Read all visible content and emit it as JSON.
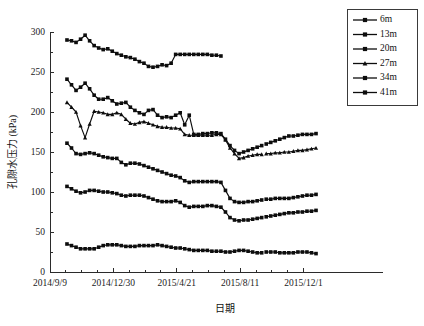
{
  "chart_data": {
    "type": "line",
    "title": "",
    "xlabel": "日期",
    "ylabel": "孔隙水压力 (kPa)",
    "ylim": [
      0,
      300
    ],
    "y_major_ticks": [
      0,
      50,
      100,
      150,
      200,
      250,
      300
    ],
    "y_tick_labels": [
      "0",
      "50",
      "100",
      "150",
      "200",
      "250",
      "300"
    ],
    "y_minor_interval": 25,
    "x_tick_labels": [
      "2014/9/9",
      "2014/12/30",
      "2015/4/21",
      "2015/8/11",
      "2015/12/1"
    ],
    "x_tick_days": [
      0,
      112,
      224,
      336,
      448
    ],
    "x_minor_interval_days": 28,
    "xlim_days": [
      0,
      500
    ],
    "grid": false,
    "legend_position": "top-right",
    "legend_entries": [
      "6m",
      "13m",
      "20m",
      "27m",
      "34m",
      "41m"
    ],
    "series": [
      {
        "name": "6m",
        "marker": "square",
        "x": [
          30,
          38,
          46,
          54,
          62,
          70,
          78,
          86,
          94,
          102,
          110,
          118,
          126,
          134,
          142,
          150,
          158,
          166,
          174,
          182,
          190,
          198,
          206,
          214,
          222,
          230,
          238,
          246,
          254,
          262,
          270,
          278,
          286,
          294,
          302,
          310,
          318,
          326,
          334,
          342,
          350,
          358,
          366,
          374,
          382,
          390,
          398,
          406,
          414,
          422,
          430,
          438,
          446,
          454,
          462,
          470
        ],
        "values": [
          35,
          33,
          31,
          29,
          29,
          29,
          29,
          31,
          33,
          34,
          34,
          34,
          33,
          32,
          32,
          32,
          33,
          33,
          33,
          33,
          34,
          33,
          32,
          31,
          30,
          30,
          29,
          28,
          27,
          27,
          27,
          27,
          26,
          26,
          26,
          25,
          25,
          26,
          27,
          27,
          26,
          25,
          24,
          24,
          25,
          25,
          25,
          24,
          24,
          24,
          24,
          25,
          25,
          25,
          24,
          23
        ]
      },
      {
        "name": "13m",
        "marker": "square",
        "x": [
          30,
          38,
          46,
          54,
          62,
          70,
          78,
          86,
          94,
          102,
          110,
          118,
          126,
          134,
          142,
          150,
          158,
          166,
          174,
          182,
          190,
          198,
          206,
          214,
          222,
          230,
          238,
          246,
          254,
          262,
          270,
          278,
          286,
          294,
          302,
          310,
          318,
          326,
          334,
          342,
          350,
          358,
          366,
          374,
          382,
          390,
          398,
          406,
          414,
          422,
          430,
          438,
          446,
          454,
          462,
          470
        ],
        "values": [
          107,
          104,
          101,
          99,
          100,
          102,
          102,
          101,
          100,
          100,
          99,
          98,
          96,
          95,
          96,
          96,
          96,
          95,
          93,
          91,
          89,
          88,
          88,
          88,
          89,
          87,
          83,
          81,
          82,
          82,
          82,
          83,
          83,
          82,
          81,
          75,
          68,
          65,
          64,
          65,
          65,
          66,
          67,
          68,
          69,
          70,
          71,
          72,
          73,
          74,
          74,
          75,
          75,
          76,
          76,
          77
        ]
      },
      {
        "name": "20m",
        "marker": "square",
        "x": [
          30,
          38,
          46,
          54,
          62,
          70,
          78,
          86,
          94,
          102,
          110,
          118,
          126,
          134,
          142,
          150,
          158,
          166,
          174,
          182,
          190,
          198,
          206,
          214,
          222,
          230,
          238,
          246,
          254,
          262,
          270,
          278,
          286,
          294,
          302,
          310,
          318,
          326,
          334,
          342,
          350,
          358,
          366,
          374,
          382,
          390,
          398,
          406,
          414,
          422,
          430,
          438,
          446,
          454,
          462,
          470
        ],
        "values": [
          161,
          155,
          148,
          147,
          148,
          149,
          148,
          146,
          144,
          143,
          142,
          142,
          137,
          134,
          136,
          136,
          135,
          133,
          131,
          129,
          127,
          125,
          123,
          121,
          120,
          118,
          114,
          112,
          113,
          113,
          113,
          113,
          113,
          113,
          112,
          102,
          92,
          88,
          87,
          87,
          88,
          88,
          89,
          90,
          91,
          91,
          92,
          92,
          92,
          92,
          93,
          94,
          95,
          96,
          96,
          97
        ]
      },
      {
        "name": "27m",
        "marker": "triangle",
        "x": [
          30,
          38,
          46,
          54,
          62,
          70,
          78,
          86,
          94,
          102,
          110,
          118,
          126,
          134,
          142,
          150,
          158,
          166,
          174,
          182,
          190,
          198,
          206,
          214,
          222,
          230,
          238,
          246,
          254,
          262,
          270,
          278,
          286,
          294,
          302,
          310,
          318,
          326,
          334,
          342,
          350,
          358,
          366,
          374,
          382,
          390,
          398,
          406,
          414,
          422,
          430,
          438,
          446,
          454,
          462,
          470
        ],
        "values": [
          212,
          206,
          200,
          183,
          168,
          185,
          201,
          200,
          199,
          197,
          197,
          199,
          197,
          191,
          186,
          185,
          187,
          188,
          186,
          184,
          182,
          181,
          181,
          180,
          180,
          179,
          172,
          171,
          171,
          171,
          171,
          171,
          171,
          172,
          172,
          165,
          155,
          148,
          142,
          143,
          145,
          146,
          147,
          147,
          148,
          148,
          149,
          149,
          150,
          150,
          151,
          152,
          152,
          153,
          154,
          155
        ]
      },
      {
        "name": "34m",
        "marker": "square",
        "x": [
          30,
          38,
          46,
          54,
          62,
          70,
          78,
          86,
          94,
          102,
          110,
          118,
          126,
          134,
          142,
          150,
          158,
          166,
          174,
          182,
          190,
          198,
          206,
          214,
          222,
          230,
          238,
          246,
          254,
          262,
          270,
          278,
          286,
          294,
          302,
          310,
          318,
          326,
          334,
          342,
          350,
          358,
          366,
          374,
          382,
          390,
          398,
          406,
          414,
          422,
          430,
          438,
          446,
          454,
          462,
          470
        ],
        "values": [
          241,
          234,
          227,
          231,
          236,
          229,
          221,
          216,
          216,
          218,
          214,
          210,
          211,
          212,
          206,
          202,
          199,
          197,
          202,
          203,
          196,
          193,
          194,
          193,
          196,
          199,
          184,
          196,
          172,
          172,
          173,
          173,
          174,
          174,
          173,
          166,
          158,
          152,
          148,
          150,
          152,
          154,
          156,
          158,
          160,
          162,
          164,
          166,
          168,
          170,
          170,
          171,
          172,
          172,
          172,
          173
        ]
      },
      {
        "name": "41m",
        "marker": "square",
        "x": [
          30,
          38,
          46,
          54,
          62,
          70,
          78,
          86,
          94,
          102,
          110,
          118,
          126,
          134,
          142,
          150,
          158,
          166,
          174,
          182,
          190,
          198,
          206,
          214,
          222,
          230,
          238,
          246,
          254,
          262,
          270,
          278,
          286,
          294,
          302
        ],
        "values": [
          290,
          289,
          287,
          291,
          296,
          289,
          283,
          280,
          278,
          279,
          276,
          273,
          271,
          269,
          268,
          266,
          263,
          261,
          257,
          256,
          257,
          259,
          258,
          261,
          272,
          272,
          272,
          272,
          272,
          272,
          272,
          272,
          271,
          271,
          270
        ]
      }
    ],
    "series_gaps": [
      [
        374,
        382
      ]
    ]
  }
}
